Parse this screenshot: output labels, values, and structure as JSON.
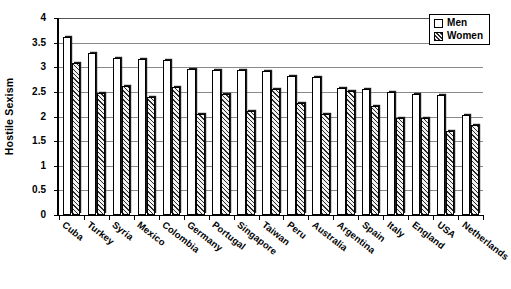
{
  "chart_data": {
    "type": "bar",
    "title": "",
    "xlabel": "",
    "ylabel": "Hostile Sexism",
    "ylim": [
      0,
      4
    ],
    "ytick_step": 0.5,
    "yticks": [
      "0",
      "0.5",
      "1",
      "1.5",
      "2",
      "2.5",
      "3",
      "3.5",
      "4"
    ],
    "grid": true,
    "grid_orientation": "horizontal",
    "legend_position": "top-right",
    "categories": [
      "Cuba",
      "Turkey",
      "Syria",
      "Mexico",
      "Colombia",
      "Germany",
      "Portugal",
      "Singapore",
      "Taiwan",
      "Peru",
      "Australia",
      "Argentina",
      "Spain",
      "Italy",
      "England",
      "USA",
      "Netherlands"
    ],
    "series": [
      {
        "name": "Men",
        "fill": "white",
        "values": [
          3.62,
          3.28,
          3.18,
          3.16,
          3.14,
          2.97,
          2.95,
          2.94,
          2.92,
          2.83,
          2.8,
          2.57,
          2.55,
          2.5,
          2.45,
          2.44,
          2.03
        ]
      },
      {
        "name": "Women",
        "fill": "hatched",
        "values": [
          3.08,
          2.48,
          2.62,
          2.4,
          2.6,
          2.06,
          2.45,
          2.12,
          2.55,
          2.28,
          2.05,
          2.52,
          2.22,
          1.97,
          1.97,
          1.7,
          1.82
        ]
      }
    ]
  },
  "legend": {
    "items": [
      {
        "label": "Men",
        "swatch": "white-square-icon"
      },
      {
        "label": "Women",
        "swatch": "hatched-square-icon"
      }
    ]
  },
  "axis": {
    "y_title": "Hostile Sexism"
  }
}
